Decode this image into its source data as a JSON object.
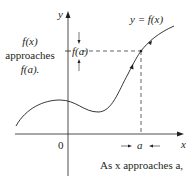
{
  "diagram": {
    "curve_label": "y = f(x)",
    "y_axis_label": "y",
    "x_axis_label": "x",
    "origin_label": "0",
    "fa_tick_label": "f(a)",
    "a_tick_label": "a",
    "left_annotation": {
      "line1": "f(x)",
      "line2": "approaches",
      "line3": "f(a)."
    },
    "bottom_annotation": "As x approaches a,",
    "colors": {
      "ink": "#231f20",
      "background": "#ffffff"
    }
  }
}
